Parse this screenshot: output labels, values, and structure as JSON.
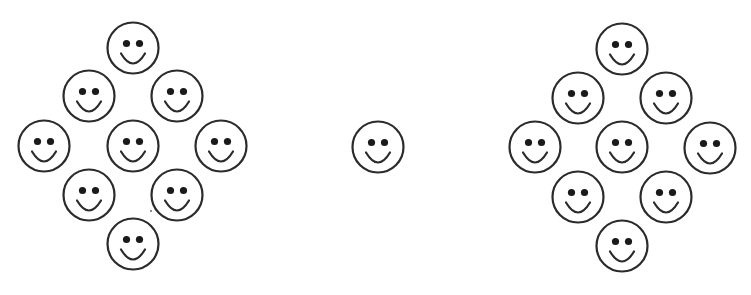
{
  "figure": {
    "width": 751,
    "height": 295,
    "background": "#ffffff",
    "stroke_color": "#2b2b2b",
    "eye_color": "#1a1a1a",
    "face_radius": 25.5,
    "eye_offset_x": 6.5,
    "eye_offset_y": -4.5,
    "eye_radius": 3.6,
    "mouth": {
      "half_width": 12,
      "top_offset": 5.5,
      "depth": 10
    }
  },
  "groups": [
    {
      "name": "left-diamond",
      "face_count": 9,
      "faces": [
        {
          "position": "top",
          "cx": 133,
          "cy": 48
        },
        {
          "position": "upper-left",
          "cx": 89,
          "cy": 96
        },
        {
          "position": "upper-right",
          "cx": 177,
          "cy": 96
        },
        {
          "position": "left",
          "cx": 44,
          "cy": 146
        },
        {
          "position": "center",
          "cx": 133,
          "cy": 146
        },
        {
          "position": "right",
          "cx": 221,
          "cy": 146
        },
        {
          "position": "lower-left",
          "cx": 89,
          "cy": 195
        },
        {
          "position": "lower-right",
          "cx": 177,
          "cy": 195
        },
        {
          "position": "bottom",
          "cx": 133,
          "cy": 244
        }
      ]
    },
    {
      "name": "single-center",
      "face_count": 1,
      "faces": [
        {
          "position": "center",
          "cx": 378,
          "cy": 147
        }
      ]
    },
    {
      "name": "right-diamond",
      "face_count": 9,
      "faces": [
        {
          "position": "top",
          "cx": 622,
          "cy": 49
        },
        {
          "position": "upper-left",
          "cx": 578,
          "cy": 98
        },
        {
          "position": "upper-right",
          "cx": 666,
          "cy": 98
        },
        {
          "position": "left",
          "cx": 535,
          "cy": 147
        },
        {
          "position": "center",
          "cx": 622,
          "cy": 147
        },
        {
          "position": "right",
          "cx": 710,
          "cy": 148
        },
        {
          "position": "lower-left",
          "cx": 578,
          "cy": 197
        },
        {
          "position": "lower-right",
          "cx": 666,
          "cy": 197
        },
        {
          "position": "bottom",
          "cx": 622,
          "cy": 246
        }
      ]
    }
  ],
  "artifacts": [
    {
      "name": "speck",
      "cx": 151,
      "cy": 211,
      "r": 0.9
    }
  ]
}
